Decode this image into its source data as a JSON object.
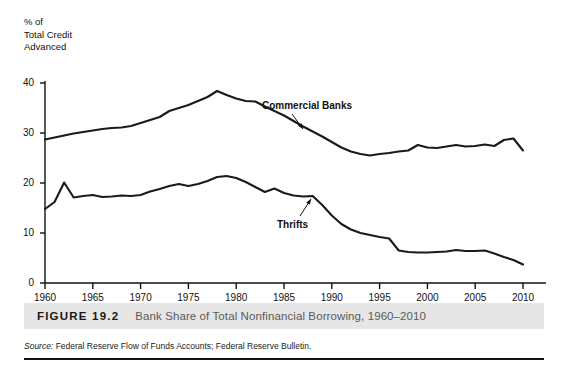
{
  "figure": {
    "number_label": "FIGURE 19.2",
    "title": "Bank Share of Total Nonfinancial Borrowing, 1960–2010",
    "source_prefix": "Source:",
    "source_text": " Federal Reserve Flow of Funds Accounts; Federal Reserve Bulletin."
  },
  "axis": {
    "y_axis_title": "% of\nTotal Credit\nAdvanced"
  },
  "chart_data": {
    "type": "line",
    "title": "Bank Share of Total Nonfinancial Borrowing, 1960–2010",
    "xlabel": "",
    "ylabel": "% of Total Credit Advanced",
    "xlim": [
      1960,
      2010
    ],
    "ylim": [
      0,
      40
    ],
    "yticks": [
      0,
      10,
      20,
      30,
      40
    ],
    "ytick_labels": [
      "0",
      "10",
      "20",
      "30",
      "40"
    ],
    "xticks": [
      1960,
      1965,
      1970,
      1975,
      1980,
      1985,
      1990,
      1995,
      2000,
      2005,
      2010
    ],
    "xtick_labels": [
      "1960",
      "1965",
      "1970",
      "1975",
      "1980",
      "1985",
      "1990",
      "1995",
      "2000",
      "2005",
      "2010"
    ],
    "grid": false,
    "legend": "inline-annotations",
    "annotations": [
      {
        "text": "Commercial Banks",
        "series": "Commercial Banks",
        "points_to_year": 1985.5,
        "points_to_value": 32.2
      },
      {
        "text": "Thrifts",
        "series": "Thrifts",
        "points_to_year": 1988.0,
        "points_to_value": 17.4
      }
    ],
    "series": [
      {
        "name": "Commercial Banks",
        "color": "#1a1a1a",
        "x": [
          1960,
          1961,
          1962,
          1963,
          1964,
          1965,
          1966,
          1967,
          1968,
          1969,
          1970,
          1971,
          1972,
          1973,
          1974,
          1975,
          1976,
          1977,
          1978,
          1979,
          1980,
          1981,
          1982,
          1983,
          1984,
          1985,
          1986,
          1987,
          1988,
          1989,
          1990,
          1991,
          1992,
          1993,
          1994,
          1995,
          1996,
          1997,
          1998,
          1999,
          2000,
          2001,
          2002,
          2003,
          2004,
          2005,
          2006,
          2007,
          2008,
          2009,
          2010
        ],
        "values": [
          28.7,
          29.1,
          29.5,
          29.9,
          30.2,
          30.5,
          30.8,
          31.0,
          31.1,
          31.4,
          32.0,
          32.6,
          33.2,
          34.4,
          35.0,
          35.6,
          36.4,
          37.2,
          38.4,
          37.6,
          36.9,
          36.4,
          36.3,
          35.3,
          34.4,
          33.5,
          32.4,
          31.3,
          30.3,
          29.3,
          28.2,
          27.1,
          26.3,
          25.8,
          25.5,
          25.8,
          26.0,
          26.3,
          26.5,
          27.6,
          27.1,
          27.0,
          27.3,
          27.6,
          27.3,
          27.4,
          27.7,
          27.4,
          28.6,
          28.9,
          26.5
        ]
      },
      {
        "name": "Thrifts",
        "color": "#1a1a1a",
        "x": [
          1960,
          1961,
          1962,
          1963,
          1964,
          1965,
          1966,
          1967,
          1968,
          1969,
          1970,
          1971,
          1972,
          1973,
          1974,
          1975,
          1976,
          1977,
          1978,
          1979,
          1980,
          1981,
          1982,
          1983,
          1984,
          1985,
          1986,
          1987,
          1988,
          1989,
          1990,
          1991,
          1992,
          1993,
          1994,
          1995,
          1996,
          1997,
          1998,
          1999,
          2000,
          2001,
          2002,
          2003,
          2004,
          2005,
          2006,
          2007,
          2008,
          2009,
          2010
        ],
        "values": [
          14.8,
          16.2,
          20.1,
          17.1,
          17.4,
          17.6,
          17.2,
          17.3,
          17.5,
          17.4,
          17.6,
          18.3,
          18.8,
          19.4,
          19.8,
          19.4,
          19.8,
          20.4,
          21.2,
          21.4,
          21.0,
          20.2,
          19.2,
          18.2,
          18.9,
          18.0,
          17.5,
          17.3,
          17.4,
          15.6,
          13.5,
          11.8,
          10.7,
          10.0,
          9.6,
          9.2,
          8.9,
          6.5,
          6.2,
          6.1,
          6.1,
          6.2,
          6.3,
          6.6,
          6.4,
          6.4,
          6.5,
          5.9,
          5.2,
          4.6,
          3.7
        ]
      }
    ]
  }
}
